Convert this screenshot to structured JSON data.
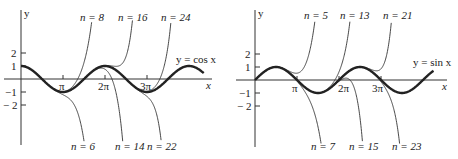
{
  "chart_data": [
    {
      "type": "line",
      "title": "",
      "function_label": "y = cos x",
      "xlabel": "x",
      "ylabel": "y",
      "x_ticks": [
        "π",
        "2π",
        "3π"
      ],
      "y_ticks": [
        "2",
        "1",
        "−1",
        "− 2"
      ],
      "xlim": [
        0,
        4.35
      ],
      "xlim_units": "π",
      "ylim": [
        -2,
        2
      ],
      "grid": false,
      "series": [
        {
          "name": "y = cos x",
          "kind": "function",
          "emphasis": "thick"
        },
        {
          "name": "n = 6",
          "kind": "taylor_polynomial",
          "degree": 6,
          "label_position": "bottom"
        },
        {
          "name": "n = 8",
          "kind": "taylor_polynomial",
          "degree": 8,
          "label_position": "top"
        },
        {
          "name": "n = 14",
          "kind": "taylor_polynomial",
          "degree": 14,
          "label_position": "bottom"
        },
        {
          "name": "n = 16",
          "kind": "taylor_polynomial",
          "degree": 16,
          "label_position": "top"
        },
        {
          "name": "n = 22",
          "kind": "taylor_polynomial",
          "degree": 22,
          "label_position": "bottom"
        },
        {
          "name": "n = 24",
          "kind": "taylor_polynomial",
          "degree": 24,
          "label_position": "top"
        }
      ]
    },
    {
      "type": "line",
      "title": "",
      "function_label": "y = sin x",
      "xlabel": "x",
      "ylabel": "y",
      "x_ticks": [
        "π",
        "2π",
        "3π"
      ],
      "y_ticks": [
        "2",
        "1",
        "−1",
        "− 2"
      ],
      "xlim": [
        0,
        4.25
      ],
      "xlim_units": "π",
      "ylim": [
        -2,
        2
      ],
      "grid": false,
      "series": [
        {
          "name": "y = sin x",
          "kind": "function",
          "emphasis": "thick"
        },
        {
          "name": "n = 5",
          "kind": "taylor_polynomial",
          "degree": 5,
          "label_position": "top"
        },
        {
          "name": "n = 7",
          "kind": "taylor_polynomial",
          "degree": 7,
          "label_position": "bottom"
        },
        {
          "name": "n = 13",
          "kind": "taylor_polynomial",
          "degree": 13,
          "label_position": "top"
        },
        {
          "name": "n = 15",
          "kind": "taylor_polynomial",
          "degree": 15,
          "label_position": "bottom"
        },
        {
          "name": "n = 21",
          "kind": "taylor_polynomial",
          "degree": 21,
          "label_position": "top"
        },
        {
          "name": "n = 23",
          "kind": "taylor_polynomial",
          "degree": 23,
          "label_position": "bottom"
        }
      ]
    }
  ],
  "left": {
    "y_axis_label": "y",
    "x_axis_label": "x",
    "function_label": "y = cos x",
    "ticks": {
      "pi": "π",
      "two_pi": "2π",
      "three_pi": "3π",
      "y2": "2",
      "y1": "1",
      "ym1": "−1",
      "ym2": "− 2"
    },
    "labels": {
      "n8": "n = 8",
      "n16": "n = 16",
      "n24": "n = 24",
      "n6": "n = 6",
      "n14": "n = 14",
      "n22": "n = 22"
    }
  },
  "right": {
    "y_axis_label": "y",
    "x_axis_label": "x",
    "function_label": "y = sin x",
    "ticks": {
      "pi": "π",
      "two_pi": "2π",
      "three_pi": "3π",
      "y2": "2",
      "y1": "1",
      "ym1": "−1",
      "ym2": "− 2"
    },
    "labels": {
      "n5": "n = 5",
      "n13": "n = 13",
      "n21": "n = 21",
      "n7": "n = 7",
      "n15": "n = 15",
      "n23": "n = 23"
    }
  }
}
